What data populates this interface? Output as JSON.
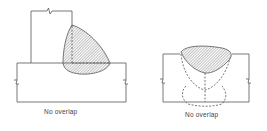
{
  "figures": [
    {
      "id": "tee-joint",
      "caption": "No overlap"
    },
    {
      "id": "butt-joint",
      "caption": "No overlap"
    }
  ],
  "colors": {
    "line": "#555555",
    "hatch": "#777777",
    "background": "#ffffff"
  }
}
